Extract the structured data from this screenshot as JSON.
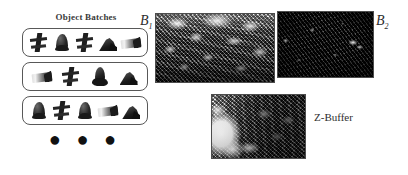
{
  "figure": {
    "background_color": "#ffffff",
    "width": 408,
    "height": 175
  },
  "batches": {
    "title": "Object Batches",
    "ellipsis": "● ● ●",
    "box_border_color": "#585858",
    "rows": [
      {
        "row_label": "batch-row-1",
        "objects": [
          {
            "name": "chair-object",
            "shape": "obj-chair"
          },
          {
            "name": "blob-object",
            "shape": "obj-blob"
          },
          {
            "name": "chair-object",
            "shape": "obj-chair"
          },
          {
            "name": "wedge-object",
            "shape": "obj-wedge"
          },
          {
            "name": "plank-object",
            "shape": "obj-plank"
          }
        ]
      },
      {
        "row_label": "batch-row-2",
        "objects": [
          {
            "name": "plank-object",
            "shape": "obj-plank"
          },
          {
            "name": "chair-object",
            "shape": "obj-chair"
          },
          {
            "name": "boot-object",
            "shape": "obj-boot"
          },
          {
            "name": "wedge-object",
            "shape": "obj-wedge"
          }
        ]
      },
      {
        "row_label": "batch-row-3",
        "objects": [
          {
            "name": "blob-object",
            "shape": "obj-blob"
          },
          {
            "name": "chair-object",
            "shape": "obj-chair"
          },
          {
            "name": "blob-object",
            "shape": "obj-blob"
          },
          {
            "name": "plank-object",
            "shape": "obj-plank"
          },
          {
            "name": "wedge-object",
            "shape": "obj-wedge"
          }
        ]
      }
    ]
  },
  "buffers": [
    {
      "id": "b1",
      "label_base": "B",
      "label_sub": "1",
      "description": "bright high-contrast rendered buffer",
      "border_color": "#4d4d4d"
    },
    {
      "id": "b2",
      "label_base": "B",
      "label_sub": "2",
      "description": "dark rendered buffer",
      "border_color": "#4d4d4d"
    },
    {
      "id": "z",
      "label": "Z-Buffer",
      "description": "depth buffer render",
      "border_color": "#4d4d4d"
    }
  ]
}
